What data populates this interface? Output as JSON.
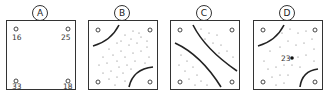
{
  "panels": [
    {
      "label": "A",
      "values": {
        "top_left": "16",
        "top_right": "25",
        "bottom_left": "33",
        "bottom_right": "18"
      }
    },
    {
      "label": "B"
    },
    {
      "label": "C"
    },
    {
      "label": "D",
      "center_value": "23"
    }
  ]
}
